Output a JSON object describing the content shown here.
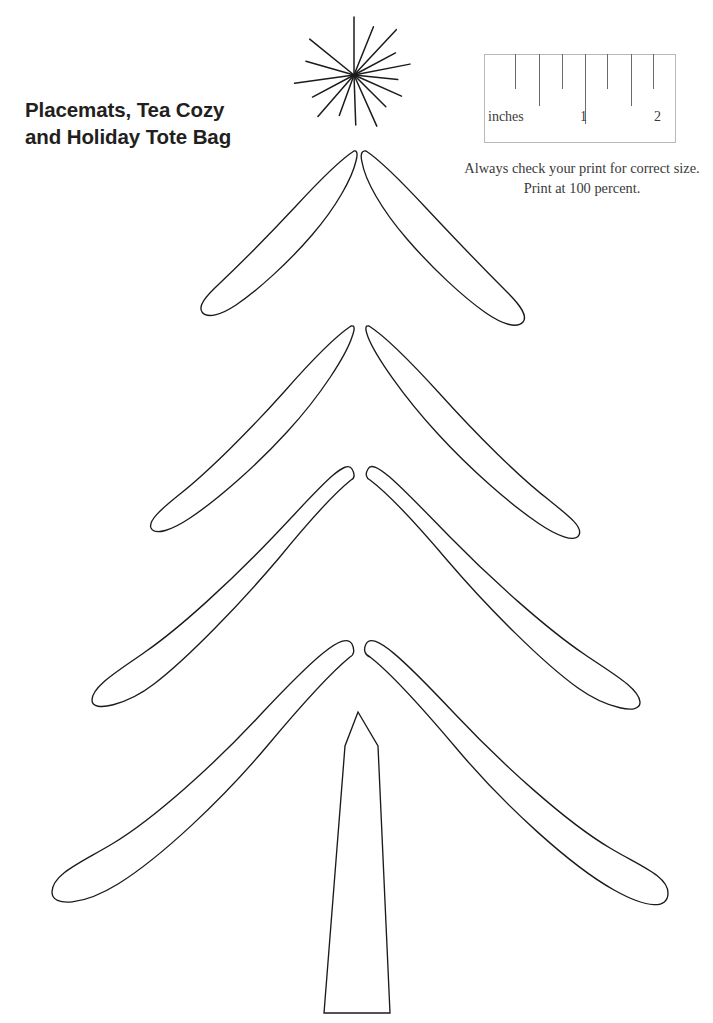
{
  "page": {
    "width": 713,
    "height": 1023,
    "background": "#ffffff",
    "ink_color": "#1b1b1b"
  },
  "title": {
    "line1": "Placemats, Tea Cozy",
    "line2": "and Holiday Tote Bag",
    "color": "#231f20"
  },
  "ruler": {
    "unit_label": "inches",
    "major_labels": [
      "1",
      "2"
    ],
    "box_border_color": "#b9b9b9",
    "tick_color": "#6a6a6a",
    "ticks": [
      {
        "x_pct": 16.0,
        "height_px": 35
      },
      {
        "x_pct": 28.5,
        "height_px": 52
      },
      {
        "x_pct": 40.5,
        "height_px": 35
      },
      {
        "x_pct": 52.5,
        "height_px": 70
      },
      {
        "x_pct": 64.0,
        "height_px": 35
      },
      {
        "x_pct": 76.5,
        "height_px": 52
      },
      {
        "x_pct": 88.0,
        "height_px": 35
      }
    ],
    "label_positions": [
      {
        "text": "inches",
        "left_px": 4,
        "top_px": 55
      },
      {
        "text": "1",
        "left_px": 96,
        "top_px": 55
      },
      {
        "text": "2",
        "left_px": 170,
        "top_px": 55
      }
    ]
  },
  "print_note": {
    "line1": "Always check your print for correct size.",
    "line2": "Print at 100 percent.",
    "color": "#3a3a3a"
  },
  "artwork": {
    "name": "christmas-tree-cut-template",
    "description": "Line-art Christmas tree pattern made of four tiers of paired leaf-shaped branches, a tapered trunk, and a starburst topper.",
    "stroke_color": "#1b1b1b",
    "stroke_width": 1.35,
    "fill": "none",
    "star": {
      "center_x": 354,
      "center_y": 75,
      "ray_count": 16,
      "rays": [
        {
          "angle_deg": -90,
          "length": 58
        },
        {
          "angle_deg": -68,
          "length": 52
        },
        {
          "angle_deg": -47,
          "length": 62
        },
        {
          "angle_deg": -28,
          "length": 47
        },
        {
          "angle_deg": -11,
          "length": 57
        },
        {
          "angle_deg": 6,
          "length": 44
        },
        {
          "angle_deg": 24,
          "length": 52
        },
        {
          "angle_deg": 45,
          "length": 45
        },
        {
          "angle_deg": 66,
          "length": 56
        },
        {
          "angle_deg": 88,
          "length": 50
        },
        {
          "angle_deg": 110,
          "length": 43
        },
        {
          "angle_deg": 131,
          "length": 55
        },
        {
          "angle_deg": 152,
          "length": 47
        },
        {
          "angle_deg": 172,
          "length": 60
        },
        {
          "angle_deg": 196,
          "length": 50
        },
        {
          "angle_deg": 219,
          "length": 57
        }
      ]
    },
    "tiers": [
      {
        "index": 1,
        "apex_y": 150,
        "left_tip_x": 205,
        "left_tip_y": 300,
        "right_tip_x": 522,
        "right_tip_y": 312
      },
      {
        "index": 2,
        "apex_y": 325,
        "left_tip_x": 148,
        "left_tip_y": 500,
        "right_tip_x": 580,
        "right_tip_y": 505
      },
      {
        "index": 3,
        "apex_y": 478,
        "left_tip_x": 92,
        "left_tip_y": 706,
        "right_tip_x": 640,
        "right_tip_y": 702
      },
      {
        "index": 4,
        "apex_y": 655,
        "left_tip_x": 52,
        "left_tip_y": 890,
        "right_tip_x": 668,
        "right_tip_y": 893
      }
    ],
    "trunk": {
      "peak_x": 358,
      "peak_y": 712,
      "top_right_x": 378,
      "top_right_y": 745,
      "bottom_left_x": 324,
      "bottom_left_y": 1013,
      "bottom_right_x": 390,
      "bottom_right_y": 1013
    }
  }
}
